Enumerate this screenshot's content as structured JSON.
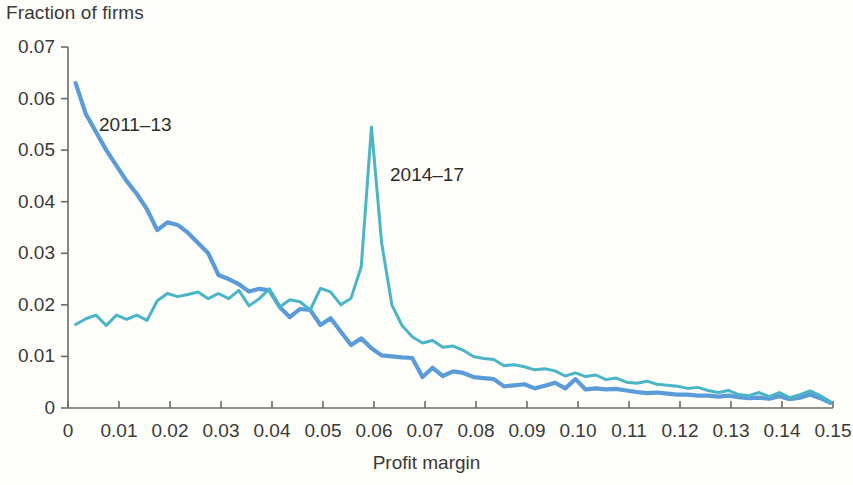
{
  "chart_data": {
    "type": "line",
    "title": "",
    "xlabel": "Profit margin",
    "ylabel": "Fraction of firms",
    "xlim": [
      0,
      0.15
    ],
    "ylim": [
      0,
      0.07
    ],
    "grid": false,
    "legend_position": "inline-annotations",
    "xticks": [
      "0",
      "0.01",
      "0.02",
      "0.03",
      "0.04",
      "0.05",
      "0.06",
      "0.07",
      "0.08",
      "0.09",
      "0.10",
      "0.11",
      "0.12",
      "0.13",
      "0.14",
      "0.15"
    ],
    "xtick_values": [
      0,
      0.01,
      0.02,
      0.03,
      0.04,
      0.05,
      0.06,
      0.07,
      0.08,
      0.09,
      0.1,
      0.11,
      0.12,
      0.13,
      0.14,
      0.15
    ],
    "yticks": [
      "0",
      "0.01",
      "0.02",
      "0.03",
      "0.04",
      "0.05",
      "0.06",
      "0.07"
    ],
    "ytick_values": [
      0,
      0.01,
      0.02,
      0.03,
      0.04,
      0.05,
      0.06,
      0.07
    ],
    "x": [
      0.0015,
      0.0035,
      0.0055,
      0.0075,
      0.0095,
      0.0115,
      0.0135,
      0.0155,
      0.0175,
      0.0195,
      0.0215,
      0.0235,
      0.0255,
      0.0275,
      0.0295,
      0.0315,
      0.0335,
      0.0355,
      0.0375,
      0.0395,
      0.0415,
      0.0435,
      0.0455,
      0.0475,
      0.0495,
      0.0515,
      0.0535,
      0.0555,
      0.0575,
      0.0595,
      0.0615,
      0.0635,
      0.0655,
      0.0675,
      0.0695,
      0.0715,
      0.0735,
      0.0755,
      0.0775,
      0.0795,
      0.0815,
      0.0835,
      0.0855,
      0.0875,
      0.0895,
      0.0915,
      0.0935,
      0.0955,
      0.0975,
      0.0995,
      0.1015,
      0.1035,
      0.1055,
      0.1075,
      0.1095,
      0.1115,
      0.1135,
      0.1155,
      0.1175,
      0.1195,
      0.1215,
      0.1235,
      0.1255,
      0.1275,
      0.1295,
      0.1315,
      0.1335,
      0.1355,
      0.1375,
      0.1395,
      0.1415,
      0.1435,
      0.1455,
      0.1475,
      0.1495
    ],
    "series": [
      {
        "name": "2011-13",
        "color": "#5b9bd8",
        "values": [
          0.063,
          0.057,
          0.0535,
          0.05,
          0.047,
          0.044,
          0.0415,
          0.0385,
          0.0345,
          0.036,
          0.0355,
          0.034,
          0.032,
          0.03,
          0.0258,
          0.025,
          0.024,
          0.0226,
          0.0231,
          0.0228,
          0.0196,
          0.0176,
          0.0192,
          0.019,
          0.0161,
          0.0174,
          0.0148,
          0.0122,
          0.0135,
          0.0116,
          0.0102,
          0.01,
          0.0098,
          0.0097,
          0.006,
          0.0078,
          0.0062,
          0.0071,
          0.0068,
          0.006,
          0.0058,
          0.0056,
          0.0042,
          0.0044,
          0.0046,
          0.0038,
          0.0043,
          0.0049,
          0.0038,
          0.0056,
          0.0036,
          0.0038,
          0.0036,
          0.0037,
          0.0034,
          0.0031,
          0.0029,
          0.003,
          0.0028,
          0.0026,
          0.0026,
          0.0024,
          0.0024,
          0.0022,
          0.0024,
          0.0021,
          0.0019,
          0.002,
          0.0018,
          0.0023,
          0.0017,
          0.002,
          0.0026,
          0.0019,
          0.001
        ]
      },
      {
        "name": "2014-17",
        "color": "#4ab5c6",
        "values": [
          0.0162,
          0.0173,
          0.018,
          0.016,
          0.018,
          0.0172,
          0.018,
          0.017,
          0.0208,
          0.0222,
          0.0216,
          0.022,
          0.0225,
          0.0212,
          0.0222,
          0.0212,
          0.0228,
          0.0198,
          0.0212,
          0.0231,
          0.0196,
          0.021,
          0.0206,
          0.019,
          0.0232,
          0.0225,
          0.02,
          0.0213,
          0.0274,
          0.0545,
          0.032,
          0.02,
          0.016,
          0.0138,
          0.0126,
          0.0131,
          0.0118,
          0.012,
          0.0112,
          0.01,
          0.0096,
          0.0094,
          0.0082,
          0.0084,
          0.008,
          0.0074,
          0.0076,
          0.0072,
          0.0062,
          0.0068,
          0.0061,
          0.0064,
          0.0055,
          0.0058,
          0.005,
          0.0048,
          0.0052,
          0.0046,
          0.0044,
          0.0042,
          0.0038,
          0.004,
          0.0034,
          0.003,
          0.0034,
          0.0026,
          0.0024,
          0.003,
          0.0022,
          0.003,
          0.002,
          0.0026,
          0.0033,
          0.0024,
          0.0012
        ]
      }
    ],
    "annotations": [
      {
        "text": "2011–13",
        "x_px": 99,
        "y_px": 114,
        "name": "series-label-2011-13"
      },
      {
        "text": "2014–17",
        "x_px": 390,
        "y_px": 164,
        "name": "series-label-2014-17"
      }
    ]
  },
  "axis_style": {
    "axis_color": "#6d6a62",
    "background": "#fdfdfa",
    "text_color": "#3a3a38"
  }
}
